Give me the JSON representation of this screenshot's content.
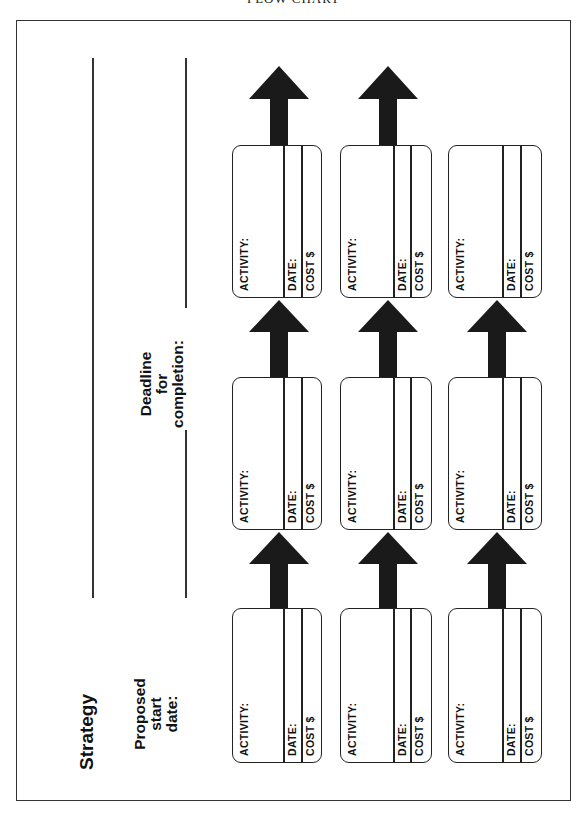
{
  "header": {
    "title": "FLOW CHART"
  },
  "labels": {
    "strategy": "Strategy",
    "proposed_start": [
      "Proposed",
      "start",
      "date:"
    ],
    "deadline": [
      "Deadline",
      "for",
      "completion:"
    ]
  },
  "box_fields": {
    "activity": "ACTIVITY:",
    "date": "DATE:",
    "cost": "COST $"
  },
  "rows": [
    {
      "boxes": [
        {
          "activity": "ACTIVITY:",
          "date": "DATE:",
          "cost": "COST $"
        },
        {
          "activity": "ACTIVITY:",
          "date": "DATE:",
          "cost": "COST $"
        },
        {
          "activity": "ACTIVITY:",
          "date": "DATE:",
          "cost": "COST $"
        }
      ],
      "has_final_arrow": true
    },
    {
      "boxes": [
        {
          "activity": "ACTIVITY:",
          "date": "DATE:",
          "cost": "COST $"
        },
        {
          "activity": "ACTIVITY:",
          "date": "DATE:",
          "cost": "COST $"
        },
        {
          "activity": "ACTIVITY:",
          "date": "DATE:",
          "cost": "COST $"
        }
      ],
      "has_final_arrow": true
    },
    {
      "boxes": [
        {
          "activity": "ACTIVITY:",
          "date": "DATE:",
          "cost": "COST $"
        },
        {
          "activity": "ACTIVITY:",
          "date": "DATE:",
          "cost": "COST $"
        },
        {
          "activity": "ACTIVITY:",
          "date": "DATE:",
          "cost": "COST $"
        }
      ],
      "has_final_arrow": false
    }
  ],
  "colors": {
    "ink": "#111111",
    "arrow": "#1a1a1a",
    "paper": "#ffffff"
  }
}
